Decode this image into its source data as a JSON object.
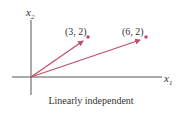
{
  "figure": {
    "caption": "Linearly independent",
    "axes": {
      "x_label": "x",
      "x_sub": "1",
      "y_label": "x",
      "y_sub": "2"
    },
    "vectors": [
      {
        "label": "(3, 2)",
        "x": 3,
        "y": 2
      },
      {
        "label": "(6, 2)",
        "x": 6,
        "y": 2
      }
    ],
    "colors": {
      "vector": "#c0506a",
      "axis": "#555555",
      "text": "#333333"
    }
  }
}
